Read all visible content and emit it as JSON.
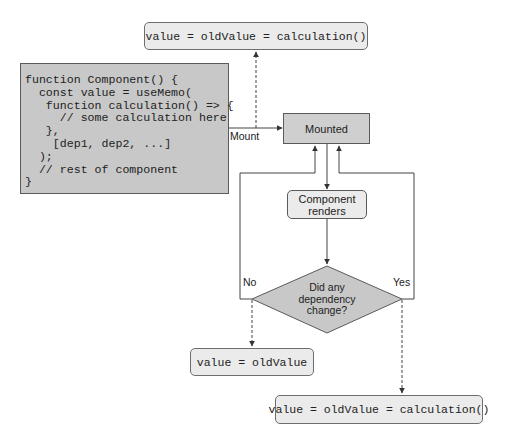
{
  "diagram": {
    "top_output": "value = oldValue = calculation()",
    "code_block": {
      "lines": [
        "function Component() {",
        "  const value = useMemo(",
        "   function calculation() => {",
        "     // some calculation here",
        "   },",
        "    [dep1, dep2, ...]",
        "  );",
        "  // rest of component",
        "}"
      ]
    },
    "edge_labels": {
      "mount": "Mount",
      "no": "No",
      "yes": "Yes"
    },
    "mounted_state": "Mounted",
    "render_box": {
      "line1": "Component",
      "line2": "renders"
    },
    "decision": {
      "line1": "Did any",
      "line2": "dependency",
      "line3": "change?"
    },
    "no_output": "value = oldValue",
    "yes_output": "value = oldValue = calculation()",
    "colors": {
      "code_block_fill": "#c8c8c8",
      "state_fill": "#cfcfcf",
      "output_fill": "#ebebeb",
      "diamond_fill": "#c8c8c8",
      "line": "#444444"
    }
  }
}
